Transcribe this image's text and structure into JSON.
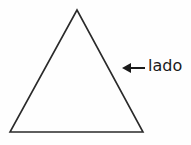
{
  "diagram": {
    "shape": "triangle",
    "label": "lado",
    "arrow_direction": "left",
    "colors": {
      "background": "#fefefe",
      "stroke": "#2a2a2a",
      "text": "#1a1a1a"
    },
    "vertices": {
      "apex": [
        77,
        10
      ],
      "bottom_left": [
        10,
        132
      ],
      "bottom_right": [
        143,
        132
      ]
    }
  }
}
